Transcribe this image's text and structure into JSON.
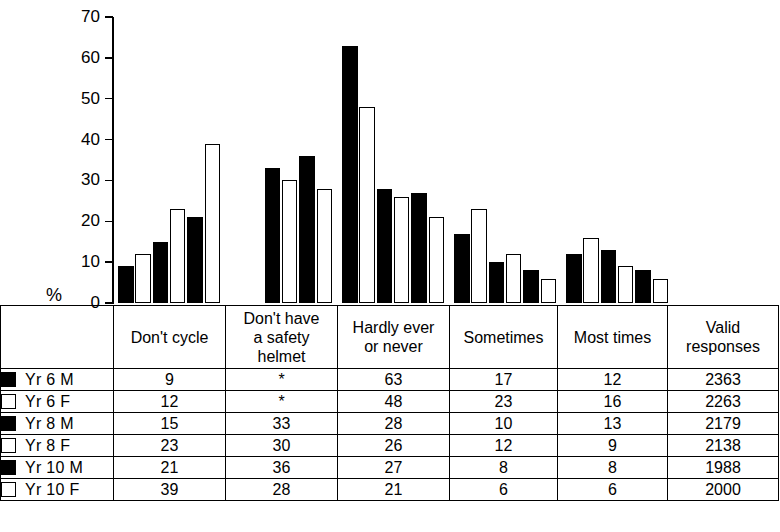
{
  "chart_data": {
    "type": "bar",
    "title": "",
    "subtitle": "",
    "xlabel": "",
    "ylabel": "%",
    "ylim": [
      0,
      70
    ],
    "yticks": [
      0,
      10,
      20,
      30,
      40,
      50,
      60,
      70
    ],
    "grid": false,
    "legend_position": "table-left-column",
    "categories": [
      "Don't cycle",
      "Don't have a safety helmet",
      "Hardly ever or never",
      "Sometimes",
      "Most times"
    ],
    "series": [
      {
        "name": "Yr 6 M",
        "marker": "filled",
        "values": [
          9,
          null,
          63,
          17,
          12
        ]
      },
      {
        "name": "Yr 6 F",
        "marker": "hollow",
        "values": [
          12,
          null,
          48,
          23,
          16
        ]
      },
      {
        "name": "Yr 8 M",
        "marker": "filled",
        "values": [
          15,
          33,
          28,
          10,
          13
        ]
      },
      {
        "name": "Yr 8 F",
        "marker": "hollow",
        "values": [
          23,
          30,
          26,
          12,
          9
        ]
      },
      {
        "name": "Yr 10 M",
        "marker": "filled",
        "values": [
          21,
          36,
          27,
          8,
          8
        ]
      },
      {
        "name": "Yr 10 F",
        "marker": "hollow",
        "values": [
          39,
          28,
          21,
          6,
          6
        ]
      }
    ],
    "missing_value_symbol": "*",
    "annotations": []
  },
  "axis": {
    "y_unit_label": "%",
    "tick_labels": [
      "70",
      "60",
      "50",
      "40",
      "30",
      "20",
      "10",
      "0"
    ]
  },
  "table": {
    "column_headers": [
      "Don't cycle",
      "Don't have a safety helmet",
      "Hardly ever or never",
      "Sometimes",
      "Most times",
      "Valid responses"
    ],
    "column_headers_lines": [
      [
        "Don't cycle"
      ],
      [
        "Don't have",
        "a safety",
        "helmet"
      ],
      [
        "Hardly ever",
        "or never"
      ],
      [
        "Sometimes"
      ],
      [
        "Most times"
      ],
      [
        "Valid",
        "responses"
      ]
    ],
    "rows": [
      {
        "label": "Yr 6 M",
        "marker": "filled",
        "cells": [
          "9",
          "*",
          "63",
          "17",
          "12",
          "2363"
        ]
      },
      {
        "label": "Yr 6 F",
        "marker": "hollow",
        "cells": [
          "12",
          "*",
          "48",
          "23",
          "16",
          "2263"
        ]
      },
      {
        "label": "Yr 8 M",
        "marker": "filled",
        "cells": [
          "15",
          "33",
          "28",
          "10",
          "13",
          "2179"
        ]
      },
      {
        "label": "Yr 8 F",
        "marker": "hollow",
        "cells": [
          "23",
          "30",
          "26",
          "12",
          "9",
          "2138"
        ]
      },
      {
        "label": "Yr 10 M",
        "marker": "filled",
        "cells": [
          "21",
          "36",
          "27",
          "8",
          "8",
          "1988"
        ]
      },
      {
        "label": "Yr 10 F",
        "marker": "hollow",
        "cells": [
          "39",
          "28",
          "21",
          "6",
          "6",
          "2000"
        ]
      }
    ]
  },
  "colors": {
    "filled": "#000000",
    "hollow": "#ffffff",
    "outline": "#000000",
    "background": "#ffffff"
  }
}
